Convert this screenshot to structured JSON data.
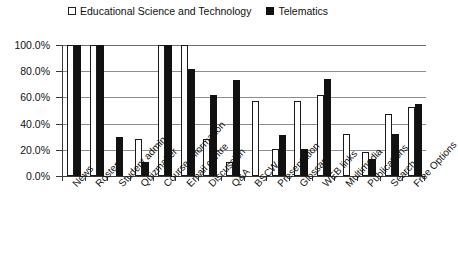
{
  "chart_data": {
    "type": "bar",
    "title": "",
    "subtitle": "",
    "xlabel": "",
    "ylabel": "",
    "ylim": [
      0,
      100
    ],
    "y_tick_labels": [
      "0.0%",
      "20.0%",
      "40.0%",
      "60.0%",
      "80.0%",
      "100.0%"
    ],
    "y_tick_values": [
      0,
      20,
      40,
      60,
      80,
      100
    ],
    "grid": true,
    "grid_axis": "y",
    "legend_position": "top-left",
    "categories": [
      "News",
      "Roster",
      "Student admin",
      "Quizmaker",
      "Course Information",
      "Email centre",
      "Discussion",
      "Q&A",
      "BSCW",
      "Presentation",
      "Glossary",
      "WEB links",
      "Multimedia",
      "Publications",
      "Search",
      "Free Options"
    ],
    "series": [
      {
        "name": "Educational Science and Technology",
        "color": "#ffffff",
        "edge_color": "#1a1a1a",
        "marker": "hollow-square",
        "values": [
          100,
          100,
          0,
          28,
          100,
          100,
          28,
          11,
          57,
          21,
          57,
          62,
          32,
          18,
          47,
          53
        ]
      },
      {
        "name": "Telematics",
        "color": "#111111",
        "edge_color": "#111111",
        "marker": "filled-square",
        "values": [
          100,
          100,
          30,
          11,
          100,
          82,
          62,
          73,
          0,
          31,
          21,
          74,
          0,
          13,
          32,
          55
        ]
      }
    ]
  },
  "legend": {
    "items": [
      {
        "label": "Educational Science and Technology",
        "marker": "hollow-square"
      },
      {
        "label": "Telematics",
        "marker": "filled-square"
      }
    ]
  },
  "axis": {
    "y_labels": [
      "100.0%",
      "80.0%",
      "60.0%",
      "40.0%",
      "20.0%",
      "0.0%"
    ]
  }
}
